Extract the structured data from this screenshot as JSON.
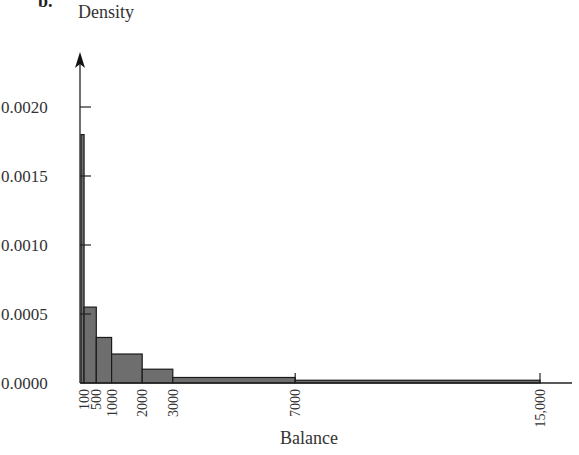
{
  "panel_label": "b.",
  "chart_data": {
    "type": "bar",
    "subtype": "histogram",
    "title": "",
    "xlabel": "Balance",
    "ylabel": "Density",
    "bins": [
      {
        "from": 0,
        "to": 100,
        "density": 0.0018
      },
      {
        "from": 100,
        "to": 500,
        "density": 0.00055
      },
      {
        "from": 500,
        "to": 1000,
        "density": 0.00033
      },
      {
        "from": 1000,
        "to": 2000,
        "density": 0.00021
      },
      {
        "from": 2000,
        "to": 3000,
        "density": 0.0001
      },
      {
        "from": 3000,
        "to": 7000,
        "density": 4e-05
      },
      {
        "from": 7000,
        "to": 15000,
        "density": 2e-05
      }
    ],
    "x_ticks": [
      {
        "value": 100,
        "label": "100"
      },
      {
        "value": 500,
        "label": "500"
      },
      {
        "value": 1000,
        "label": "1000"
      },
      {
        "value": 2000,
        "label": "2000"
      },
      {
        "value": 3000,
        "label": "3000"
      },
      {
        "value": 7000,
        "label": "7000"
      },
      {
        "value": 15000,
        "label": "15,000"
      }
    ],
    "y_ticks": [
      {
        "value": 0.0,
        "label": "0.0000"
      },
      {
        "value": 0.0005,
        "label": "0.0005"
      },
      {
        "value": 0.001,
        "label": "0.0010"
      },
      {
        "value": 0.0015,
        "label": "0.0015"
      },
      {
        "value": 0.002,
        "label": "0.0020"
      }
    ],
    "xlim": [
      0,
      16000
    ],
    "ylim": [
      0,
      0.0022
    ],
    "grid": false,
    "legend": null,
    "bar_color": "#6e6e6e",
    "edge_color": "#1a1a1a"
  }
}
